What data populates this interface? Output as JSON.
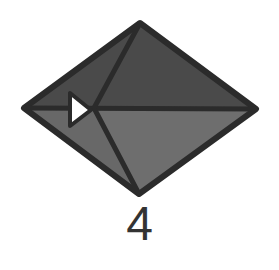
{
  "diagram": {
    "type": "origami-step",
    "step_label": "4",
    "shape": "diamond",
    "colors": {
      "upper_face": "#4a4a4a",
      "lower_face": "#6e6e6e",
      "outline": "#2b2b2b",
      "arrow_fill": "#ffffff",
      "label": "#333333"
    },
    "vertices": {
      "top": [
        140,
        23
      ],
      "bottom": [
        139,
        194
      ],
      "left": [
        24,
        108
      ],
      "right": [
        256,
        109
      ]
    },
    "fold_point": [
      94,
      108
    ],
    "arrow": {
      "kind": "push-in triangle",
      "points": [
        [
          70,
          93
        ],
        [
          70,
          126
        ],
        [
          90,
          110
        ]
      ]
    }
  }
}
